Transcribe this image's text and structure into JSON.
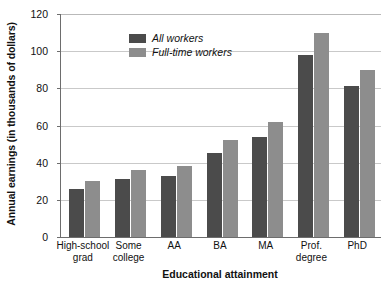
{
  "chart_data": {
    "type": "bar",
    "title": "",
    "xlabel": "Educational attainment",
    "ylabel": "Annual earnings (in thousands of dollars)",
    "categories": [
      "High-school\ngrad",
      "Some\ncollege",
      "AA",
      "BA",
      "MA",
      "Prof.\ndegree",
      "PhD"
    ],
    "series": [
      {
        "name": "All workers",
        "color": "#4b4b4b",
        "values": [
          26,
          31,
          33,
          45,
          54,
          98,
          81
        ]
      },
      {
        "name": "Full-time workers",
        "color": "#8d8d8d",
        "values": [
          30,
          36,
          38,
          52,
          62,
          110,
          90
        ]
      }
    ],
    "ylim": [
      0,
      120
    ],
    "yticks": [
      0,
      20,
      40,
      60,
      80,
      100,
      120
    ],
    "ytick_labels": [
      "0",
      "20",
      "40",
      "60",
      "80",
      "100",
      "120"
    ],
    "grid": true,
    "legend_position": "top-left"
  },
  "axes": {
    "y_title": "Annual earnings (in thousands of dollars)",
    "x_title": "Educational attainment"
  }
}
